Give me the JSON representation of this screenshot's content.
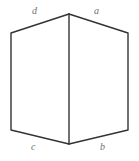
{
  "figure": {
    "canvas": {
      "width": 139,
      "height": 161,
      "background": "#ffffff"
    },
    "stroke": {
      "color": "#333333",
      "width": 1.4
    },
    "vertices": {
      "top_apex": {
        "x": 69,
        "y": 14
      },
      "top_left": {
        "x": 11,
        "y": 33
      },
      "top_right": {
        "x": 128,
        "y": 33
      },
      "bottom_left": {
        "x": 11,
        "y": 130
      },
      "bottom_right": {
        "x": 128,
        "y": 130
      },
      "bottom_apex": {
        "x": 69,
        "y": 144
      }
    },
    "edges": [
      {
        "name": "top-left-edge",
        "from": "top_left",
        "to": "top_apex"
      },
      {
        "name": "top-right-edge",
        "from": "top_apex",
        "to": "top_right"
      },
      {
        "name": "right-side-edge",
        "from": "top_right",
        "to": "bottom_right"
      },
      {
        "name": "bottom-right-edge",
        "from": "bottom_right",
        "to": "bottom_apex"
      },
      {
        "name": "bottom-left-edge",
        "from": "bottom_apex",
        "to": "bottom_left"
      },
      {
        "name": "left-side-edge",
        "from": "bottom_left",
        "to": "top_left"
      },
      {
        "name": "center-vertical-edge",
        "from": "top_apex",
        "to": "bottom_apex"
      }
    ],
    "labels": {
      "top_left": "d",
      "top_right": "a",
      "bottom_left": "c",
      "bottom_right": "b",
      "color": "#6f6f6f"
    }
  }
}
